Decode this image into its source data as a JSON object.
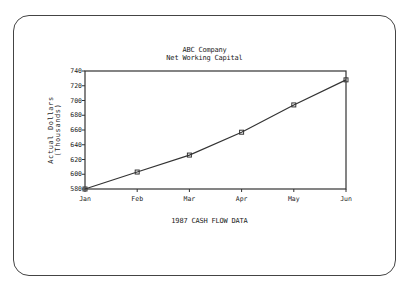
{
  "chart_data": {
    "type": "line",
    "title": "ABC Company",
    "subtitle": "Net Working Capital",
    "xlabel": "1987 CASH FLOW DATA",
    "ylabel": "Actual Dollars",
    "ylabel_sub": "(Thousands)",
    "categories": [
      "Jan",
      "Feb",
      "Mar",
      "Apr",
      "May",
      "Jun"
    ],
    "series": [
      {
        "name": "Net Working Capital",
        "values": [
          580,
          603,
          626,
          657,
          694,
          728
        ]
      }
    ],
    "yticks": [
      580,
      600,
      620,
      640,
      660,
      680,
      700,
      720,
      740
    ],
    "ylim": [
      580,
      740
    ],
    "grid": false,
    "legend": "none",
    "marker": "square",
    "line_color": "#333333"
  }
}
